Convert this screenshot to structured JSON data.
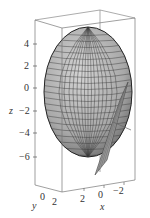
{
  "figure": {
    "z_axis": {
      "label": "z",
      "ticks": [
        "4",
        "2",
        "0",
        "−2",
        "−4",
        "−6"
      ]
    },
    "y_axis": {
      "label": "y",
      "ticks": [
        "0",
        "2"
      ]
    },
    "x_axis": {
      "label": "x",
      "ticks": [
        "2",
        "0",
        "−2"
      ]
    },
    "colors": {
      "surface": "#b8b8b8",
      "mesh": "#333333",
      "box": "#777777",
      "plane": "#a0a0a0"
    }
  }
}
